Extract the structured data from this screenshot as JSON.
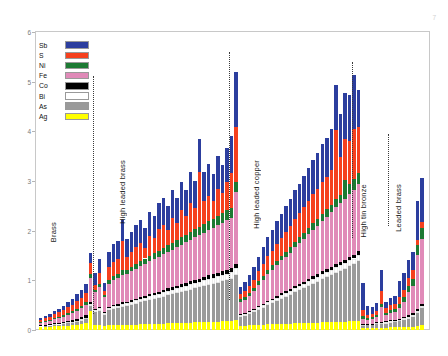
{
  "chart_data": {
    "type": "bar",
    "subtype": "stacked",
    "title": "",
    "xlabel": "",
    "ylabel": "",
    "ylim": [
      0,
      6
    ],
    "yticks": [
      0,
      1,
      2,
      3,
      4,
      5,
      6
    ],
    "grid": false,
    "legend_position": "top-left",
    "legend": [
      {
        "label": "Sb",
        "color": "#2c3e9e"
      },
      {
        "label": "S",
        "color": "#f5401e"
      },
      {
        "label": "Ni",
        "color": "#1d7a33"
      },
      {
        "label": "Fe",
        "color": "#e08ab8"
      },
      {
        "label": "Co",
        "color": "#000000"
      },
      {
        "label": "Bi",
        "color": "#ffffff"
      },
      {
        "label": "As",
        "color": "#9a9a9a"
      },
      {
        "label": "Ag",
        "color": "#ffff00"
      }
    ],
    "series_order_bottom_to_top": [
      "Ag",
      "As",
      "Bi",
      "Co",
      "Fe",
      "Ni",
      "S",
      "Sb"
    ],
    "groups": [
      {
        "label": "Brass",
        "n": 12
      },
      {
        "label": "High leaded brass",
        "n": 30
      },
      {
        "label": "High leaded copper",
        "n": 27
      },
      {
        "label": "High tin bronze",
        "n": 8
      },
      {
        "label": "Leaded brass",
        "n": 6
      }
    ],
    "corner_label": "7",
    "bars": [
      {
        "g": 0,
        "Ag": 0.06,
        "As": 0.02,
        "Bi": 0.01,
        "Co": 0.01,
        "Fe": 0.05,
        "Ni": 0.02,
        "S": 0.04,
        "Sb": 0.03
      },
      {
        "g": 0,
        "Ag": 0.07,
        "As": 0.02,
        "Bi": 0.01,
        "Co": 0.01,
        "Fe": 0.06,
        "Ni": 0.02,
        "S": 0.05,
        "Sb": 0.04
      },
      {
        "g": 0,
        "Ag": 0.07,
        "As": 0.03,
        "Bi": 0.01,
        "Co": 0.01,
        "Fe": 0.07,
        "Ni": 0.02,
        "S": 0.06,
        "Sb": 0.05
      },
      {
        "g": 0,
        "Ag": 0.08,
        "As": 0.03,
        "Bi": 0.01,
        "Co": 0.02,
        "Fe": 0.08,
        "Ni": 0.03,
        "S": 0.07,
        "Sb": 0.06
      },
      {
        "g": 0,
        "Ag": 0.08,
        "As": 0.04,
        "Bi": 0.01,
        "Co": 0.02,
        "Fe": 0.09,
        "Ni": 0.03,
        "S": 0.09,
        "Sb": 0.07
      },
      {
        "g": 0,
        "Ag": 0.09,
        "As": 0.04,
        "Bi": 0.02,
        "Co": 0.02,
        "Fe": 0.1,
        "Ni": 0.03,
        "S": 0.1,
        "Sb": 0.08
      },
      {
        "g": 0,
        "Ag": 0.09,
        "As": 0.05,
        "Bi": 0.02,
        "Co": 0.02,
        "Fe": 0.12,
        "Ni": 0.04,
        "S": 0.12,
        "Sb": 0.1
      },
      {
        "g": 0,
        "Ag": 0.1,
        "As": 0.05,
        "Bi": 0.02,
        "Co": 0.03,
        "Fe": 0.14,
        "Ni": 0.04,
        "S": 0.13,
        "Sb": 0.12
      },
      {
        "g": 0,
        "Ag": 0.11,
        "As": 0.06,
        "Bi": 0.02,
        "Co": 0.03,
        "Fe": 0.16,
        "Ni": 0.05,
        "S": 0.15,
        "Sb": 0.14
      },
      {
        "g": 0,
        "Ag": 0.12,
        "As": 0.07,
        "Bi": 0.03,
        "Co": 0.04,
        "Fe": 0.18,
        "Ni": 0.05,
        "S": 0.16,
        "Sb": 0.16
      },
      {
        "g": 0,
        "Ag": 0.14,
        "As": 0.08,
        "Bi": 0.03,
        "Co": 0.05,
        "Fe": 0.2,
        "Ni": 0.06,
        "S": 0.18,
        "Sb": 0.18
      },
      {
        "g": 0,
        "Ag": 0.38,
        "As": 0.1,
        "Bi": 0.04,
        "Co": 0.05,
        "Fe": 0.48,
        "Ni": 0.07,
        "S": 0.22,
        "Sb": 0.21
      },
      {
        "g": 1,
        "Ag": 0.1,
        "As": 0.26,
        "Bi": 0.04,
        "Co": 0.02,
        "Fe": 0.34,
        "Ni": 0.05,
        "S": 0.1,
        "Sb": 0.24
      },
      {
        "g": 1,
        "Ag": 0.11,
        "As": 0.28,
        "Bi": 0.05,
        "Co": 0.02,
        "Fe": 0.4,
        "Ni": 0.06,
        "S": 0.22,
        "Sb": 0.3
      },
      {
        "g": 1,
        "Ag": 0.09,
        "As": 0.22,
        "Bi": 0.04,
        "Co": 0.02,
        "Fe": 0.3,
        "Ni": 0.04,
        "S": 0.08,
        "Sb": 0.16
      },
      {
        "g": 1,
        "Ag": 0.1,
        "As": 0.3,
        "Bi": 0.05,
        "Co": 0.02,
        "Fe": 0.46,
        "Ni": 0.07,
        "S": 0.26,
        "Sb": 0.32
      },
      {
        "g": 1,
        "Ag": 0.11,
        "As": 0.32,
        "Bi": 0.05,
        "Co": 0.03,
        "Fe": 0.5,
        "Ni": 0.08,
        "S": 0.28,
        "Sb": 0.36
      },
      {
        "g": 1,
        "Ag": 0.1,
        "As": 0.34,
        "Bi": 0.05,
        "Co": 0.03,
        "Fe": 0.52,
        "Ni": 0.08,
        "S": 0.3,
        "Sb": 0.38
      },
      {
        "g": 1,
        "Ag": 0.11,
        "As": 0.36,
        "Bi": 0.06,
        "Co": 0.03,
        "Fe": 0.55,
        "Ni": 0.09,
        "S": 0.6,
        "Sb": 0.42
      },
      {
        "g": 1,
        "Ag": 0.1,
        "As": 0.38,
        "Bi": 0.06,
        "Co": 0.03,
        "Fe": 0.56,
        "Ni": 0.08,
        "S": 0.26,
        "Sb": 0.36
      },
      {
        "g": 1,
        "Ag": 0.11,
        "As": 0.4,
        "Bi": 0.06,
        "Co": 0.03,
        "Fe": 0.58,
        "Ni": 0.09,
        "S": 0.3,
        "Sb": 0.4
      },
      {
        "g": 1,
        "Ag": 0.11,
        "As": 0.42,
        "Bi": 0.07,
        "Co": 0.03,
        "Fe": 0.6,
        "Ni": 0.1,
        "S": 0.34,
        "Sb": 0.44
      },
      {
        "g": 1,
        "Ag": 0.12,
        "As": 0.44,
        "Bi": 0.07,
        "Co": 0.04,
        "Fe": 0.62,
        "Ni": 0.1,
        "S": 0.36,
        "Sb": 0.46
      },
      {
        "g": 1,
        "Ag": 0.12,
        "As": 0.46,
        "Bi": 0.07,
        "Co": 0.04,
        "Fe": 0.64,
        "Ni": 0.11,
        "S": 0.22,
        "Sb": 0.4
      },
      {
        "g": 1,
        "Ag": 0.12,
        "As": 0.48,
        "Bi": 0.08,
        "Co": 0.04,
        "Fe": 0.66,
        "Ni": 0.11,
        "S": 0.4,
        "Sb": 0.48
      },
      {
        "g": 1,
        "Ag": 0.13,
        "As": 0.5,
        "Bi": 0.08,
        "Co": 0.04,
        "Fe": 0.68,
        "Ni": 0.12,
        "S": 0.3,
        "Sb": 0.44
      },
      {
        "g": 1,
        "Ag": 0.13,
        "As": 0.52,
        "Bi": 0.08,
        "Co": 0.04,
        "Fe": 0.7,
        "Ni": 0.12,
        "S": 0.44,
        "Sb": 0.52
      },
      {
        "g": 1,
        "Ag": 0.13,
        "As": 0.54,
        "Bi": 0.09,
        "Co": 0.05,
        "Fe": 0.72,
        "Ni": 0.13,
        "S": 0.46,
        "Sb": 0.54
      },
      {
        "g": 1,
        "Ag": 0.14,
        "As": 0.56,
        "Bi": 0.09,
        "Co": 0.05,
        "Fe": 0.74,
        "Ni": 0.13,
        "S": 0.3,
        "Sb": 0.48
      },
      {
        "g": 1,
        "Ag": 0.14,
        "As": 0.58,
        "Bi": 0.09,
        "Co": 0.05,
        "Fe": 0.76,
        "Ni": 0.14,
        "S": 0.5,
        "Sb": 0.56
      },
      {
        "g": 1,
        "Ag": 0.14,
        "As": 0.6,
        "Bi": 0.1,
        "Co": 0.05,
        "Fe": 0.78,
        "Ni": 0.14,
        "S": 0.34,
        "Sb": 0.5
      },
      {
        "g": 1,
        "Ag": 0.15,
        "As": 0.62,
        "Bi": 0.1,
        "Co": 0.05,
        "Fe": 0.8,
        "Ni": 0.15,
        "S": 0.54,
        "Sb": 0.58
      },
      {
        "g": 1,
        "Ag": 0.15,
        "As": 0.64,
        "Bi": 0.1,
        "Co": 0.06,
        "Fe": 0.82,
        "Ni": 0.15,
        "S": 0.38,
        "Sb": 0.52
      },
      {
        "g": 1,
        "Ag": 0.15,
        "As": 0.66,
        "Bi": 0.11,
        "Co": 0.06,
        "Fe": 0.84,
        "Ni": 0.16,
        "S": 0.58,
        "Sb": 0.62
      },
      {
        "g": 1,
        "Ag": 0.16,
        "As": 0.68,
        "Bi": 0.11,
        "Co": 0.06,
        "Fe": 0.86,
        "Ni": 0.16,
        "S": 0.42,
        "Sb": 0.56
      },
      {
        "g": 1,
        "Ag": 0.16,
        "As": 0.7,
        "Bi": 0.11,
        "Co": 0.06,
        "Fe": 0.88,
        "Ni": 0.17,
        "S": 1.1,
        "Sb": 0.66
      },
      {
        "g": 1,
        "Ag": 0.16,
        "As": 0.72,
        "Bi": 0.12,
        "Co": 0.06,
        "Fe": 0.9,
        "Ni": 0.17,
        "S": 0.46,
        "Sb": 0.6
      },
      {
        "g": 1,
        "Ag": 0.17,
        "As": 0.74,
        "Bi": 0.12,
        "Co": 0.07,
        "Fe": 0.92,
        "Ni": 0.18,
        "S": 0.5,
        "Sb": 0.64
      },
      {
        "g": 1,
        "Ag": 0.17,
        "As": 0.76,
        "Bi": 0.12,
        "Co": 0.07,
        "Fe": 0.94,
        "Ni": 0.18,
        "S": 0.36,
        "Sb": 0.54
      },
      {
        "g": 1,
        "Ag": 0.17,
        "As": 0.78,
        "Bi": 0.13,
        "Co": 0.07,
        "Fe": 0.96,
        "Ni": 0.19,
        "S": 0.54,
        "Sb": 0.66
      },
      {
        "g": 1,
        "Ag": 0.18,
        "As": 0.8,
        "Bi": 0.13,
        "Co": 0.07,
        "Fe": 0.98,
        "Ni": 0.19,
        "S": 0.4,
        "Sb": 0.58
      },
      {
        "g": 1,
        "Ag": 0.18,
        "As": 0.82,
        "Bi": 0.13,
        "Co": 0.08,
        "Fe": 1.0,
        "Ni": 0.2,
        "S": 0.58,
        "Sb": 0.68
      },
      {
        "g": 1,
        "Ag": 0.18,
        "As": 0.84,
        "Bi": 0.14,
        "Co": 0.08,
        "Fe": 1.02,
        "Ni": 0.2,
        "S": 0.7,
        "Sb": 0.74
      },
      {
        "g": 2,
        "Ag": 0.2,
        "As": 0.9,
        "Bi": 0.14,
        "Co": 0.08,
        "Fe": 1.45,
        "Ni": 0.22,
        "S": 1.1,
        "Sb": 1.1
      },
      {
        "g": 2,
        "Ag": 0.09,
        "As": 0.18,
        "Bi": 0.04,
        "Co": 0.02,
        "Fe": 0.24,
        "Ni": 0.05,
        "S": 0.1,
        "Sb": 0.14
      },
      {
        "g": 2,
        "Ag": 0.09,
        "As": 0.2,
        "Bi": 0.04,
        "Co": 0.02,
        "Fe": 0.26,
        "Ni": 0.05,
        "S": 0.12,
        "Sb": 0.18
      },
      {
        "g": 2,
        "Ag": 0.1,
        "As": 0.22,
        "Bi": 0.04,
        "Co": 0.02,
        "Fe": 0.3,
        "Ni": 0.06,
        "S": 0.14,
        "Sb": 0.22
      },
      {
        "g": 2,
        "Ag": 0.1,
        "As": 0.26,
        "Bi": 0.05,
        "Co": 0.02,
        "Fe": 0.36,
        "Ni": 0.06,
        "S": 0.16,
        "Sb": 0.26
      },
      {
        "g": 2,
        "Ag": 0.11,
        "As": 0.3,
        "Bi": 0.05,
        "Co": 0.03,
        "Fe": 0.42,
        "Ni": 0.07,
        "S": 0.2,
        "Sb": 0.3
      },
      {
        "g": 2,
        "Ag": 0.11,
        "As": 0.34,
        "Bi": 0.05,
        "Co": 0.03,
        "Fe": 0.48,
        "Ni": 0.08,
        "S": 0.24,
        "Sb": 0.34
      },
      {
        "g": 2,
        "Ag": 0.12,
        "As": 0.38,
        "Bi": 0.06,
        "Co": 0.03,
        "Fe": 0.54,
        "Ni": 0.08,
        "S": 0.28,
        "Sb": 0.38
      },
      {
        "g": 2,
        "Ag": 0.12,
        "As": 0.42,
        "Bi": 0.06,
        "Co": 0.03,
        "Fe": 0.58,
        "Ni": 0.09,
        "S": 0.3,
        "Sb": 0.42
      },
      {
        "g": 2,
        "Ag": 0.12,
        "As": 0.46,
        "Bi": 0.06,
        "Co": 0.04,
        "Fe": 0.62,
        "Ni": 0.09,
        "S": 0.34,
        "Sb": 0.46
      },
      {
        "g": 2,
        "Ag": 0.13,
        "As": 0.5,
        "Bi": 0.07,
        "Co": 0.04,
        "Fe": 0.66,
        "Ni": 0.1,
        "S": 0.36,
        "Sb": 0.48
      },
      {
        "g": 2,
        "Ag": 0.13,
        "As": 0.54,
        "Bi": 0.07,
        "Co": 0.04,
        "Fe": 0.7,
        "Ni": 0.1,
        "S": 0.4,
        "Sb": 0.52
      },
      {
        "g": 2,
        "Ag": 0.13,
        "As": 0.58,
        "Bi": 0.07,
        "Co": 0.04,
        "Fe": 0.74,
        "Ni": 0.11,
        "S": 0.42,
        "Sb": 0.54
      },
      {
        "g": 2,
        "Ag": 0.14,
        "As": 0.62,
        "Bi": 0.08,
        "Co": 0.05,
        "Fe": 0.78,
        "Ni": 0.11,
        "S": 0.46,
        "Sb": 0.58
      },
      {
        "g": 2,
        "Ag": 0.14,
        "As": 0.66,
        "Bi": 0.08,
        "Co": 0.05,
        "Fe": 0.82,
        "Ni": 0.12,
        "S": 0.48,
        "Sb": 0.6
      },
      {
        "g": 2,
        "Ag": 0.14,
        "As": 0.7,
        "Bi": 0.08,
        "Co": 0.05,
        "Fe": 0.86,
        "Ni": 0.12,
        "S": 0.52,
        "Sb": 0.64
      },
      {
        "g": 2,
        "Ag": 0.15,
        "As": 0.74,
        "Bi": 0.09,
        "Co": 0.05,
        "Fe": 0.9,
        "Ni": 0.13,
        "S": 0.54,
        "Sb": 0.66
      },
      {
        "g": 2,
        "Ag": 0.15,
        "As": 0.78,
        "Bi": 0.09,
        "Co": 0.06,
        "Fe": 0.94,
        "Ni": 0.13,
        "S": 0.58,
        "Sb": 0.7
      },
      {
        "g": 2,
        "Ag": 0.15,
        "As": 0.82,
        "Bi": 0.09,
        "Co": 0.06,
        "Fe": 0.98,
        "Ni": 0.14,
        "S": 0.6,
        "Sb": 0.72
      },
      {
        "g": 2,
        "Ag": 0.16,
        "As": 0.86,
        "Bi": 0.1,
        "Co": 0.06,
        "Fe": 1.02,
        "Ni": 0.14,
        "S": 0.64,
        "Sb": 0.76
      },
      {
        "g": 2,
        "Ag": 0.16,
        "As": 0.9,
        "Bi": 0.1,
        "Co": 0.06,
        "Fe": 1.06,
        "Ni": 0.15,
        "S": 0.66,
        "Sb": 0.78
      },
      {
        "g": 2,
        "Ag": 0.16,
        "As": 0.94,
        "Bi": 0.1,
        "Co": 0.07,
        "Fe": 1.1,
        "Ni": 0.15,
        "S": 0.7,
        "Sb": 0.82
      },
      {
        "g": 2,
        "Ag": 0.17,
        "As": 0.98,
        "Bi": 0.11,
        "Co": 0.07,
        "Fe": 1.14,
        "Ni": 0.16,
        "S": 1.4,
        "Sb": 0.9
      },
      {
        "g": 2,
        "Ag": 0.17,
        "As": 1.02,
        "Bi": 0.11,
        "Co": 0.07,
        "Fe": 1.18,
        "Ni": 0.16,
        "S": 0.78,
        "Sb": 0.86
      },
      {
        "g": 2,
        "Ag": 0.17,
        "As": 1.06,
        "Bi": 0.11,
        "Co": 0.07,
        "Fe": 1.22,
        "Ni": 0.4,
        "S": 0.82,
        "Sb": 0.92
      },
      {
        "g": 2,
        "Ag": 0.18,
        "As": 1.1,
        "Bi": 0.12,
        "Co": 0.08,
        "Fe": 1.26,
        "Ni": 0.2,
        "S": 0.86,
        "Sb": 0.94
      },
      {
        "g": 2,
        "Ag": 0.18,
        "As": 1.14,
        "Bi": 0.12,
        "Co": 0.08,
        "Fe": 1.3,
        "Ni": 0.22,
        "S": 1.0,
        "Sb": 1.1
      },
      {
        "g": 2,
        "Ag": 0.19,
        "As": 1.2,
        "Bi": 0.12,
        "Co": 0.08,
        "Fe": 1.34,
        "Ni": 0.24,
        "S": 0.92,
        "Sb": 0.74
      },
      {
        "g": 3,
        "Ag": 0.04,
        "As": 0.05,
        "Bi": 0.02,
        "Co": 0.02,
        "Fe": 0.1,
        "Ni": 0.05,
        "S": 0.12,
        "Sb": 0.55
      },
      {
        "g": 3,
        "Ag": 0.04,
        "As": 0.06,
        "Bi": 0.02,
        "Co": 0.01,
        "Fe": 0.08,
        "Ni": 0.04,
        "S": 0.06,
        "Sb": 0.18
      },
      {
        "g": 3,
        "Ag": 0.04,
        "As": 0.06,
        "Bi": 0.02,
        "Co": 0.01,
        "Fe": 0.09,
        "Ni": 0.04,
        "S": 0.07,
        "Sb": 0.14
      },
      {
        "g": 3,
        "Ag": 0.05,
        "As": 0.07,
        "Bi": 0.02,
        "Co": 0.02,
        "Fe": 0.1,
        "Ni": 0.05,
        "S": 0.08,
        "Sb": 0.16
      },
      {
        "g": 3,
        "Ag": 0.05,
        "As": 0.08,
        "Bi": 0.02,
        "Co": 0.02,
        "Fe": 0.3,
        "Ni": 0.06,
        "S": 0.26,
        "Sb": 0.42
      },
      {
        "g": 3,
        "Ag": 0.05,
        "As": 0.08,
        "Bi": 0.03,
        "Co": 0.02,
        "Fe": 0.12,
        "Ni": 0.05,
        "S": 0.09,
        "Sb": 0.12
      },
      {
        "g": 3,
        "Ag": 0.06,
        "As": 0.09,
        "Bi": 0.03,
        "Co": 0.02,
        "Fe": 0.14,
        "Ni": 0.06,
        "S": 0.1,
        "Sb": 0.14
      },
      {
        "g": 3,
        "Ag": 0.06,
        "As": 0.1,
        "Bi": 0.03,
        "Co": 0.02,
        "Fe": 0.15,
        "Ni": 0.06,
        "S": 0.11,
        "Sb": 0.16
      },
      {
        "g": 4,
        "Ag": 0.06,
        "As": 0.12,
        "Bi": 0.03,
        "Co": 0.02,
        "Fe": 0.22,
        "Ni": 0.08,
        "S": 0.14,
        "Sb": 0.32
      },
      {
        "g": 4,
        "Ag": 0.06,
        "As": 0.14,
        "Bi": 0.04,
        "Co": 0.03,
        "Fe": 0.3,
        "Ni": 0.1,
        "S": 0.14,
        "Sb": 0.34
      },
      {
        "g": 4,
        "Ag": 0.07,
        "As": 0.16,
        "Bi": 0.04,
        "Co": 0.03,
        "Fe": 0.46,
        "Ni": 0.12,
        "S": 0.16,
        "Sb": 0.36
      },
      {
        "g": 4,
        "Ag": 0.07,
        "As": 0.2,
        "Bi": 0.04,
        "Co": 0.03,
        "Fe": 0.54,
        "Ni": 0.14,
        "S": 0.18,
        "Sb": 0.38
      },
      {
        "g": 4,
        "Ag": 0.08,
        "As": 0.26,
        "Bi": 0.05,
        "Co": 0.03,
        "Fe": 1.1,
        "Ni": 0.2,
        "S": 0.1,
        "Sb": 0.78
      },
      {
        "g": 4,
        "Ag": 0.1,
        "As": 0.34,
        "Bi": 0.05,
        "Co": 0.04,
        "Fe": 1.3,
        "Ni": 0.22,
        "S": 0.12,
        "Sb": 0.9
      }
    ]
  }
}
